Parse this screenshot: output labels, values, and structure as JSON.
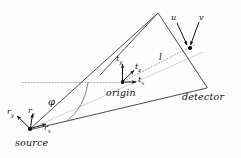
{
  "figure": {
    "type": "geometry-diagram",
    "background_color": "#fdfdfd",
    "stroke_color": "#3a3a3a",
    "faint_stroke_color": "#b9b9b9",
    "dotted_stroke_color": "#9a9a9a"
  },
  "labels": {
    "source": "source",
    "origin": "origin",
    "detector": "detector",
    "phi": "φ",
    "distance_l": "l",
    "detector_u": "u",
    "detector_v": "v",
    "source_rx_base": "r",
    "source_rx_sub": "x",
    "source_ry_base": "r",
    "source_ry_sub": "y",
    "source_rz_base": "r",
    "source_rz_sub": "z",
    "origin_tx_base": "t",
    "origin_tx_sub": "x",
    "origin_ty_base": "t",
    "origin_ty_sub": "y",
    "origin_tz_base": "t",
    "origin_tz_sub": "z"
  },
  "points": {
    "source": {
      "x": 30,
      "y": 129
    },
    "origin": {
      "x": 122,
      "y": 82
    },
    "detector_center": {
      "x": 190,
      "y": 48
    },
    "detector_apex": {
      "x": 158,
      "y": 13
    },
    "detector_bottom": {
      "x": 207,
      "y": 88
    }
  },
  "geometry": {
    "cone_upper_edge": "30,129 158,13",
    "cone_lower_edge": "30,129 207,88",
    "detector_plane_edge": "158,13 207,88",
    "detector_back_edge": "158,13 103,72",
    "central_ray": "30,129 207,88",
    "horizontal_dotted": "22,82 122,82",
    "ray_l_dotted": "122,82 196,44"
  }
}
